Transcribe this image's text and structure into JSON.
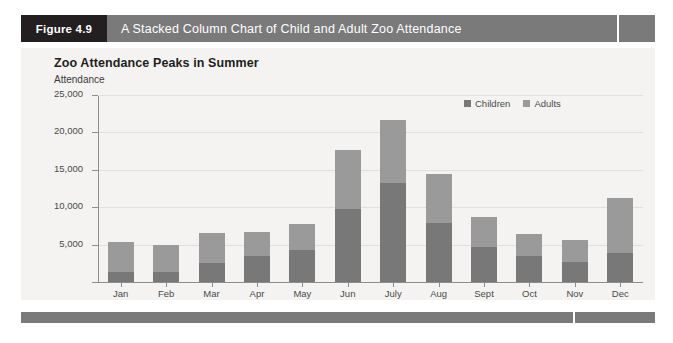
{
  "figure": {
    "number_label": "Figure 4.9",
    "caption": "A Stacked Column Chart of Child and Adult Zoo Attendance",
    "header_bg": "#7a7a7a",
    "number_bg": "#231f20"
  },
  "chart_data": {
    "type": "bar",
    "stacked": true,
    "title": "Zoo Attendance Peaks in Summer",
    "xlabel": "",
    "ylabel": "Attendance",
    "categories": [
      "Jan",
      "Feb",
      "Mar",
      "Apr",
      "May",
      "Jun",
      "July",
      "Aug",
      "Sept",
      "Oct",
      "Nov",
      "Dec"
    ],
    "series": [
      {
        "name": "Children",
        "color": "#787878",
        "values": [
          1400,
          1400,
          2500,
          3500,
          4300,
          9800,
          13200,
          7900,
          4700,
          3500,
          2700,
          3900
        ]
      },
      {
        "name": "Adults",
        "color": "#9a9a9a",
        "values": [
          4000,
          3500,
          4000,
          3200,
          3400,
          7800,
          8400,
          6500,
          4000,
          2950,
          2900,
          7350
        ]
      }
    ],
    "totals": [
      5400,
      4900,
      6500,
      6700,
      7700,
      17600,
      21600,
      14400,
      8700,
      6450,
      5600,
      11250
    ],
    "ylim": [
      0,
      25000
    ],
    "ytick_values": [
      0,
      5000,
      10000,
      15000,
      20000,
      25000
    ],
    "ytick_labels": [
      "",
      "5,000",
      "10,000",
      "15,000",
      "20,000",
      "25,000"
    ],
    "grid": true,
    "legend_position": "top-right",
    "legend_entries": [
      "Children",
      "Adults"
    ],
    "plot_bg": "#f4f3f1"
  }
}
